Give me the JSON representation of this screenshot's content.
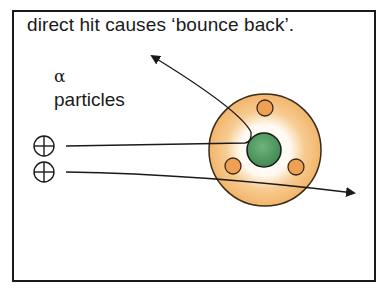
{
  "caption": "direct hit causes ‘bounce back’.",
  "label": {
    "symbol": "α",
    "text": "particles"
  },
  "diagram": {
    "atom": {
      "shell_color": "#f2b56b",
      "inner_glow_color": "#ffffff",
      "nucleus_color": "#4a9a5c",
      "electron_color": "#f0a052",
      "electron_count": 3
    },
    "alpha_particles": [
      {
        "symbol": "⊕",
        "path": "deflected back (bounce back)"
      },
      {
        "symbol": "⊕",
        "path": "passes through, slightly deflected"
      }
    ],
    "stroke_color": "#1a1a1a"
  }
}
